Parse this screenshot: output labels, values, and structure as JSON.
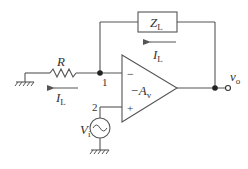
{
  "diagram": {
    "type": "circuit-schematic",
    "components": {
      "resistor": {
        "label": "R"
      },
      "load": {
        "label_main": "Z",
        "label_sub": "L"
      },
      "opamp": {
        "gain_main": "−A",
        "gain_sub": "v",
        "inverting_sign": "−",
        "noninverting_sign": "+"
      },
      "source": {
        "label_main": "V",
        "label_sub": "i"
      }
    },
    "nodes": {
      "node1": "1",
      "node2": "2"
    },
    "currents": {
      "top": {
        "label_main": "I",
        "label_sub": "L",
        "direction": "left"
      },
      "bottom": {
        "label_main": "I",
        "label_sub": "L",
        "direction": "left"
      }
    },
    "output": {
      "label_main": "v",
      "label_sub": "o"
    },
    "colors": {
      "line": "#555555",
      "text": "#333333",
      "background": "#ffffff"
    }
  }
}
